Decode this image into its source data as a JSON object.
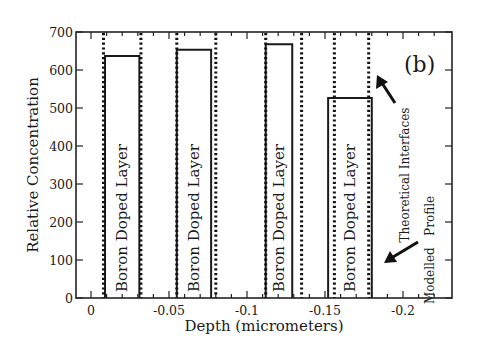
{
  "chart_data": {
    "type": "bar",
    "title": "",
    "panel_label": "(b)",
    "xlabel": "Depth (micrometers)",
    "ylabel": "Relative Concentration",
    "xlim": [
      0.01,
      -0.232
    ],
    "ylim": [
      0,
      700
    ],
    "x_ticks": [
      0,
      -0.05,
      -0.1,
      -0.15,
      -0.2
    ],
    "x_tick_labels": [
      "0",
      "-0.05",
      "-0.1",
      "-0.15",
      "-0.2"
    ],
    "x_minor_step": 0.01,
    "y_ticks": [
      0,
      100,
      200,
      300,
      400,
      500,
      600,
      700
    ],
    "y_tick_labels": [
      "0",
      "100",
      "200",
      "300",
      "400",
      "500",
      "600",
      "700"
    ],
    "grid": false,
    "series": [
      {
        "name": "Modelled Profile",
        "style": "solid-rect",
        "layers": [
          {
            "label": "Boron Doped Layer",
            "x_start": -0.009,
            "x_end": -0.031,
            "value": 637
          },
          {
            "label": "Boron Doped Layer",
            "x_start": -0.055,
            "x_end": -0.077,
            "value": 653
          },
          {
            "label": "Boron Doped Layer",
            "x_start": -0.112,
            "x_end": -0.129,
            "value": 668
          },
          {
            "label": "Boron Doped Layer",
            "x_start": -0.152,
            "x_end": -0.18,
            "value": 526
          }
        ]
      },
      {
        "name": "Theoretical Interfaces",
        "style": "dotted-vertical",
        "positions": [
          -0.008,
          -0.032,
          -0.055,
          -0.08,
          -0.112,
          -0.135,
          -0.156,
          -0.178
        ]
      }
    ],
    "annotations": [
      {
        "text": "Theoretical Interfaces",
        "rotation": -90,
        "arrow_to": "dotted interface line"
      },
      {
        "text": "Modelled   Profile",
        "rotation": -90,
        "arrow_to": "solid profile edge"
      }
    ]
  },
  "labels": {
    "panel": "(b)",
    "xlabel": "Depth (micrometers)",
    "ylabel": "Relative Concentration",
    "legend_theoretical": "Theoretical Interfaces",
    "legend_modelled": "Modelled   Profile"
  }
}
